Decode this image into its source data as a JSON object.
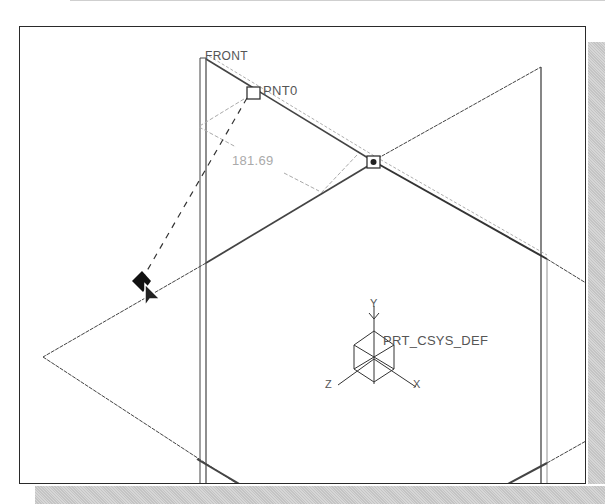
{
  "viewport": {
    "datum_plane_label": "FRONT",
    "datum_point_label": "PNT0",
    "dimension_value": "181.69",
    "csys_label": "PRT_CSYS_DEF",
    "csys_overlap_label": "BRMJS",
    "axis_labels": {
      "x": "X",
      "y": "Y",
      "z": "Z"
    }
  },
  "colors": {
    "background": "#ffffff",
    "geometry": "#333333",
    "dimension": "#999999",
    "shadow": "#cccccc"
  }
}
